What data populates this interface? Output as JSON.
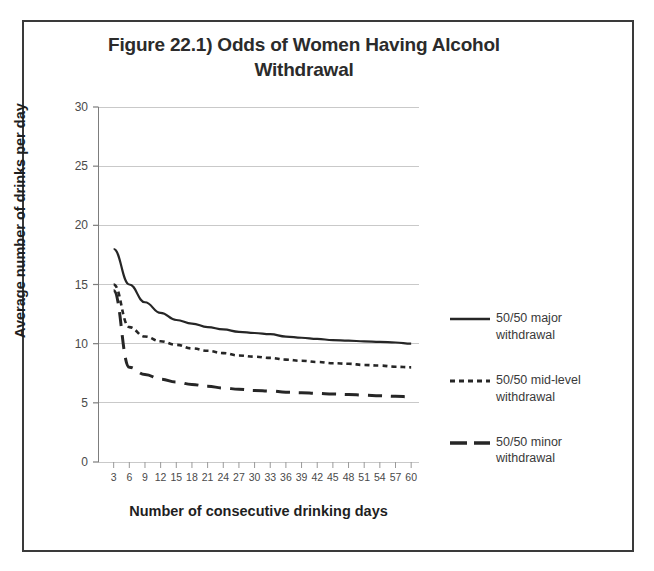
{
  "figure": {
    "title": "Figure 22.1) Odds of Women Having Alcohol Withdrawal"
  },
  "chart_data": {
    "type": "line",
    "title": "Figure 22.1) Odds of Women Having Alcohol Withdrawal",
    "xlabel": "Number of consecutive drinking days",
    "ylabel": "Average number of drinks per day",
    "xlim": [
      0,
      61.5
    ],
    "ylim": [
      0,
      30
    ],
    "yticks": [
      0,
      5,
      10,
      15,
      20,
      25,
      30
    ],
    "xticks": [
      3,
      6,
      9,
      12,
      15,
      18,
      21,
      24,
      27,
      30,
      33,
      36,
      39,
      42,
      45,
      48,
      51,
      54,
      57,
      60
    ],
    "grid": "horizontal",
    "legend_position": "right",
    "x": [
      3,
      6,
      9,
      12,
      15,
      18,
      21,
      24,
      27,
      30,
      33,
      36,
      39,
      42,
      45,
      48,
      51,
      54,
      57,
      60
    ],
    "series": [
      {
        "name": "50/50 major withdrawal",
        "style": "solid",
        "color": "#262626",
        "values": [
          18.0,
          15.0,
          13.5,
          12.6,
          12.0,
          11.7,
          11.4,
          11.2,
          11.0,
          10.9,
          10.8,
          10.6,
          10.5,
          10.4,
          10.3,
          10.25,
          10.2,
          10.15,
          10.1,
          10.0
        ]
      },
      {
        "name": "50/50 mid-level withdrawal",
        "style": "dotted",
        "color": "#262626",
        "values": [
          15.0,
          11.4,
          10.6,
          10.2,
          9.9,
          9.6,
          9.4,
          9.2,
          9.0,
          8.9,
          8.8,
          8.65,
          8.55,
          8.45,
          8.35,
          8.3,
          8.2,
          8.15,
          8.05,
          8.0
        ]
      },
      {
        "name": "50/50 minor withdrawal",
        "style": "dashed",
        "color": "#262626",
        "values": [
          14.5,
          8.0,
          7.4,
          7.0,
          6.75,
          6.55,
          6.4,
          6.25,
          6.15,
          6.05,
          6.0,
          5.9,
          5.85,
          5.8,
          5.75,
          5.7,
          5.65,
          5.6,
          5.55,
          5.5
        ]
      }
    ]
  },
  "legend": {
    "entries": [
      {
        "label": "50/50 major withdrawal",
        "style": "solid"
      },
      {
        "label": "50/50 mid-level withdrawal",
        "style": "dotted"
      },
      {
        "label": "50/50 minor withdrawal",
        "style": "dashed"
      }
    ]
  },
  "colors": {
    "frame": "#3a3a3a",
    "gridline": "#c9c9c9",
    "axis": "#8a8a8a",
    "series": "#262626",
    "text": "#2b2b2b"
  }
}
